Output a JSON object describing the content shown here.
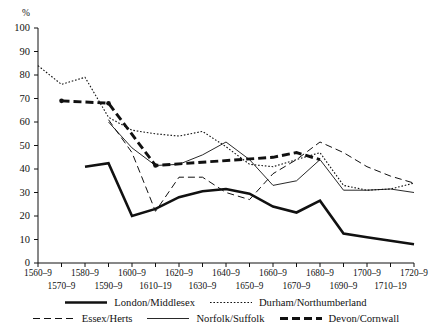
{
  "axes": {
    "ylabel": "%",
    "yticks": [
      100,
      90,
      80,
      70,
      60,
      50,
      40,
      30,
      20,
      10,
      0
    ],
    "xticks_row1": [
      "1560–9",
      "1580–9",
      "1600–9",
      "1620–9",
      "1640–9",
      "1660–9",
      "1680–9",
      "1700–9",
      "1720–9"
    ],
    "xticks_row2": [
      "1570–9",
      "1590–9",
      "1610–19",
      "1630–9",
      "1650–9",
      "1670–9",
      "1690–9",
      "1710–19"
    ]
  },
  "legend": {
    "row1": [
      {
        "label": "London/Middlesex",
        "style": "solid-thick"
      },
      {
        "label": "Durham/Northumberland",
        "style": "dotted"
      }
    ],
    "row2": [
      {
        "label": "Essex/Herts",
        "style": "dashed-long"
      },
      {
        "label": "Norfolk/Suffolk",
        "style": "solid-thin"
      },
      {
        "label": "Devon/Cornwall",
        "style": "dashed-thick"
      }
    ]
  },
  "chart_data": {
    "type": "line",
    "title": "",
    "xlabel": "",
    "ylabel": "%",
    "ylim": [
      0,
      100
    ],
    "xlim": [
      "1560-9",
      "1720-9"
    ],
    "grid": false,
    "legend_position": "bottom",
    "x": [
      "1560-9",
      "1570-9",
      "1580-9",
      "1590-9",
      "1600-9",
      "1610-19",
      "1620-9",
      "1630-9",
      "1640-9",
      "1650-9",
      "1660-9",
      "1670-9",
      "1680-9",
      "1690-9",
      "1700-9",
      "1710-19",
      "1720-9"
    ],
    "series": [
      {
        "name": "London/Middlesex",
        "style": "solid-thick",
        "points": [
          {
            "x": "1580-9",
            "y": 41
          },
          {
            "x": "1590-9",
            "y": 42.5
          },
          {
            "x": "1600-9",
            "y": 20
          },
          {
            "x": "1610-19",
            "y": 23
          },
          {
            "x": "1620-9",
            "y": 28
          },
          {
            "x": "1630-9",
            "y": 30.5
          },
          {
            "x": "1640-9",
            "y": 31.5
          },
          {
            "x": "1650-9",
            "y": 29.5
          },
          {
            "x": "1660-9",
            "y": 24
          },
          {
            "x": "1670-9",
            "y": 21.5
          },
          {
            "x": "1680-9",
            "y": 26.5
          },
          {
            "x": "1690-9",
            "y": 12.5
          },
          {
            "x": "1700-9",
            "y": 11
          },
          {
            "x": "1710-19",
            "y": 9.5
          },
          {
            "x": "1720-9",
            "y": 8
          }
        ]
      },
      {
        "name": "Durham/Northumberland",
        "style": "dotted",
        "points": [
          {
            "x": "1560-9",
            "y": 84
          },
          {
            "x": "1570-9",
            "y": 76
          },
          {
            "x": "1580-9",
            "y": 79
          },
          {
            "x": "1590-9",
            "y": 62
          },
          {
            "x": "1600-9",
            "y": 56.5
          },
          {
            "x": "1610-19",
            "y": 55
          },
          {
            "x": "1620-9",
            "y": 54
          },
          {
            "x": "1630-9",
            "y": 56
          },
          {
            "x": "1640-9",
            "y": 49.5
          },
          {
            "x": "1650-9",
            "y": 42
          },
          {
            "x": "1660-9",
            "y": 41
          },
          {
            "x": "1670-9",
            "y": 44
          },
          {
            "x": "1680-9",
            "y": 47
          },
          {
            "x": "1690-9",
            "y": 33
          },
          {
            "x": "1700-9",
            "y": 31
          },
          {
            "x": "1710-19",
            "y": 31.5
          },
          {
            "x": "1720-9",
            "y": 34
          }
        ]
      },
      {
        "name": "Essex/Herts",
        "style": "dashed-long",
        "points": [
          {
            "x": "1590-9",
            "y": 61
          },
          {
            "x": "1600-9",
            "y": 47
          },
          {
            "x": "1610-19",
            "y": 22
          },
          {
            "x": "1620-9",
            "y": 36.5
          },
          {
            "x": "1630-9",
            "y": 36.5
          },
          {
            "x": "1640-9",
            "y": 30
          },
          {
            "x": "1650-9",
            "y": 27
          },
          {
            "x": "1660-9",
            "y": 38
          },
          {
            "x": "1670-9",
            "y": 44
          },
          {
            "x": "1680-9",
            "y": 51.5
          },
          {
            "x": "1690-9",
            "y": 47
          },
          {
            "x": "1700-9",
            "y": 41
          },
          {
            "x": "1710-19",
            "y": 37
          },
          {
            "x": "1720-9",
            "y": 34
          }
        ]
      },
      {
        "name": "Norfolk/Suffolk",
        "style": "solid-thin",
        "points": [
          {
            "x": "1590-9",
            "y": 60
          },
          {
            "x": "1600-9",
            "y": 49
          },
          {
            "x": "1610-19",
            "y": 41.5
          },
          {
            "x": "1620-9",
            "y": 42
          },
          {
            "x": "1630-9",
            "y": 46
          },
          {
            "x": "1640-9",
            "y": 51.5
          },
          {
            "x": "1650-9",
            "y": 44
          },
          {
            "x": "1660-9",
            "y": 33
          },
          {
            "x": "1670-9",
            "y": 35
          },
          {
            "x": "1680-9",
            "y": 44
          },
          {
            "x": "1690-9",
            "y": 31
          },
          {
            "x": "1700-9",
            "y": 31
          },
          {
            "x": "1710-19",
            "y": 31.5
          },
          {
            "x": "1720-9",
            "y": 30
          }
        ]
      },
      {
        "name": "Devon/Cornwall",
        "style": "dashed-thick",
        "points": [
          {
            "x": "1570-9",
            "y": 69,
            "marker": true
          },
          {
            "x": "1590-9",
            "y": 68,
            "marker": true
          },
          {
            "x": "1610-19",
            "y": 41.5,
            "marker": true
          },
          {
            "x": "1660-9",
            "y": 45
          },
          {
            "x": "1670-9",
            "y": 47
          },
          {
            "x": "1680-9",
            "y": 44
          }
        ]
      }
    ]
  }
}
